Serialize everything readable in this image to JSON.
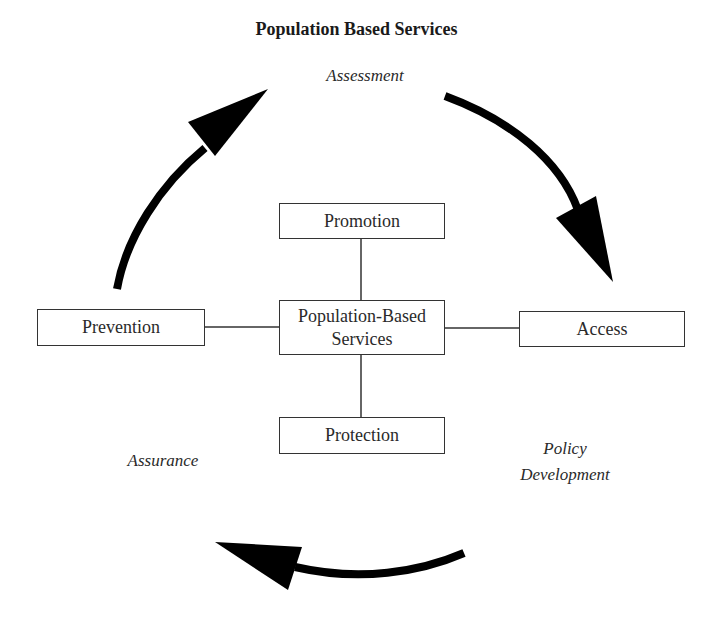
{
  "title": "Population Based Services",
  "phases": {
    "assessment": "Assessment",
    "policy_development_line1": "Policy",
    "policy_development_line2": "Development",
    "assurance": "Assurance"
  },
  "nodes": {
    "center_line1": "Population-Based",
    "center_line2": "Services",
    "promotion": "Promotion",
    "protection": "Protection",
    "prevention": "Prevention",
    "access": "Access"
  },
  "arrows": [
    {
      "from": "Assurance",
      "to": "Assessment",
      "direction": "clockwise"
    },
    {
      "from": "Assessment",
      "to": "Policy Development",
      "direction": "clockwise"
    },
    {
      "from": "Policy Development",
      "to": "Assurance",
      "direction": "clockwise"
    }
  ],
  "colors": {
    "stroke": "#000000",
    "box_border": "#333333",
    "text": "#2a2a2a"
  }
}
